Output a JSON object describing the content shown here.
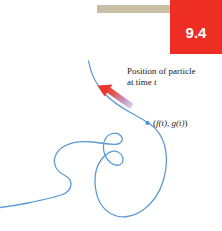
{
  "figure": {
    "section_number": "9.4",
    "rule_bar_color": "#c9bfa6",
    "badge_color": "#ee2d24",
    "badge_text_color": "#ffffff",
    "curve_color": "#5b9bd5",
    "arrow_head_color": "#e8392e",
    "arrow_tail_color": "#8f6fb5",
    "point_marker_color": "#4a90d9",
    "background_color": "#ffffff"
  },
  "annotations": {
    "position_caption_line1": "Position of particle",
    "position_caption_line2_prefix": "at time ",
    "position_caption_line2_var": "t",
    "point_label_open": "(",
    "point_label_f": "f",
    "point_label_ft_args": "(t)",
    "point_label_sep": ", ",
    "point_label_g": "g",
    "point_label_gt_args": "(t)",
    "point_label_close": ")"
  }
}
